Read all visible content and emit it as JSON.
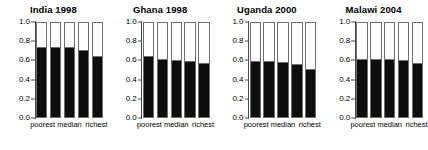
{
  "chart_data": {
    "type": "bar",
    "title": "",
    "layout": "1x4 panel grid of stacked bar charts",
    "xlabel": "",
    "ylabel": "",
    "ylim": [
      0.0,
      1.0
    ],
    "yticks": [
      "0.0",
      "0.2",
      "0.4",
      "0.6",
      "0.8",
      "1.0"
    ],
    "ytick_values": [
      0.0,
      0.2,
      0.4,
      0.6,
      0.8,
      1.0
    ],
    "grid": false,
    "legend": "none",
    "categories": [
      "poorest",
      "",
      "median",
      "",
      "richest"
    ],
    "tick_labels": [
      "poorest",
      "median",
      "richest"
    ],
    "stacked_total": 1.0,
    "colors": {
      "filled": "#0d0d0d",
      "remainder": "#ffffff",
      "border": "#6e6e6e",
      "axis": "#4a4a4a",
      "text": "#000000",
      "background": "#ffffff"
    },
    "panels": [
      {
        "title": "India 1998",
        "values": [
          0.74,
          0.74,
          0.74,
          0.71,
          0.65
        ],
        "remainders": [
          0.26,
          0.26,
          0.26,
          0.29,
          0.35
        ]
      },
      {
        "title": "Ghana 1998",
        "values": [
          0.65,
          0.62,
          0.61,
          0.6,
          0.57
        ],
        "remainders": [
          0.35,
          0.38,
          0.39,
          0.4,
          0.43
        ]
      },
      {
        "title": "Uganda 2000",
        "values": [
          0.6,
          0.6,
          0.58,
          0.56,
          0.51
        ],
        "remainders": [
          0.4,
          0.4,
          0.42,
          0.44,
          0.49
        ]
      },
      {
        "title": "Malawi 2004",
        "values": [
          0.62,
          0.62,
          0.62,
          0.61,
          0.57
        ],
        "remainders": [
          0.38,
          0.38,
          0.38,
          0.39,
          0.43
        ]
      }
    ]
  }
}
